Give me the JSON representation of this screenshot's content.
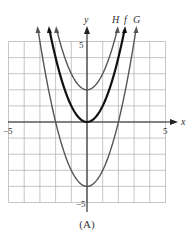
{
  "chart_data": {
    "type": "line",
    "title": "",
    "caption": "(A)",
    "xlabel": "x",
    "ylabel": "y",
    "xlim": [
      -5,
      5
    ],
    "ylim": [
      -5,
      5
    ],
    "grid": true,
    "x_ticks_labeled": [
      {
        "value": -5,
        "label": "−5"
      },
      {
        "value": 5,
        "label": "5"
      }
    ],
    "y_ticks_labeled": [
      {
        "value": 5,
        "label": "5"
      },
      {
        "value": -5,
        "label": "−5"
      }
    ],
    "series": [
      {
        "name": "H",
        "expression": "x^2 + 2",
        "vertex": [
          0,
          2
        ],
        "color": "#555555",
        "stroke_width": 1.4,
        "x": [
          -2.5,
          -2,
          -1.5,
          -1,
          -0.5,
          0,
          0.5,
          1,
          1.5,
          2,
          2.5
        ],
        "y": [
          8.25,
          6,
          4.25,
          3,
          2.25,
          2,
          2.25,
          3,
          4.25,
          6,
          8.25
        ]
      },
      {
        "name": "f",
        "expression": "x^2",
        "vertex": [
          0,
          0
        ],
        "color": "#111111",
        "stroke_width": 2.2,
        "x": [
          -2.5,
          -2,
          -1.5,
          -1,
          -0.5,
          0,
          0.5,
          1,
          1.5,
          2,
          2.5
        ],
        "y": [
          6.25,
          4,
          2.25,
          1,
          0.25,
          0,
          0.25,
          1,
          2.25,
          4,
          6.25
        ]
      },
      {
        "name": "G",
        "expression": "x^2 - 4",
        "vertex": [
          0,
          -4
        ],
        "color": "#555555",
        "stroke_width": 1.4,
        "x": [
          -3,
          -2.5,
          -2,
          -1.5,
          -1,
          -0.5,
          0,
          0.5,
          1,
          1.5,
          2,
          2.5,
          3
        ],
        "y": [
          5,
          2.25,
          0,
          -1.75,
          -3,
          -3.75,
          -4,
          -3.75,
          -3,
          -1.75,
          0,
          2.25,
          5
        ]
      }
    ],
    "legend": {
      "position": "top-right, labels at curve ends",
      "entries": [
        "H",
        "f",
        "G"
      ]
    }
  },
  "labels": {
    "x_axis": "x",
    "y_axis": "y",
    "x_min": "−5",
    "x_max": "5",
    "y_max": "5",
    "y_min": "−5",
    "curve_H": "H",
    "curve_f": "f",
    "curve_G": "G",
    "caption": "(A)"
  },
  "colors": {
    "grid": "#b8b8b8",
    "axis": "#222222",
    "curve_light": "#555555",
    "curve_bold": "#111111"
  }
}
